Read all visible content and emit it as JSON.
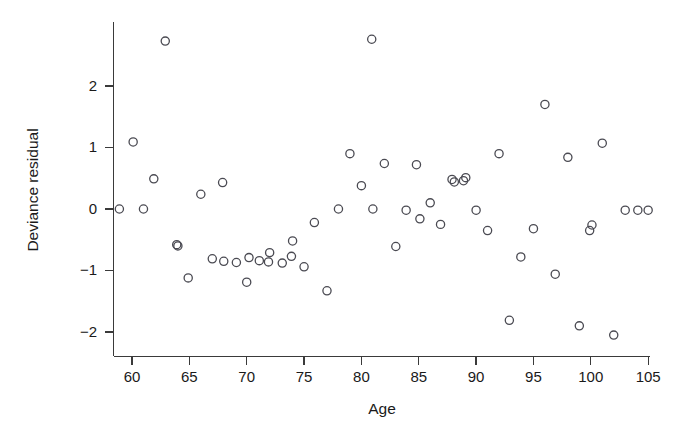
{
  "chart_data": {
    "type": "scatter",
    "title": "",
    "xlabel": "Age",
    "ylabel": "Deviance residual",
    "xlim": [
      58.2,
      105.8
    ],
    "ylim": [
      -2.35,
      3.0
    ],
    "xticks": [
      60,
      65,
      70,
      75,
      80,
      85,
      90,
      95,
      100,
      105
    ],
    "yticks": [
      2,
      1,
      0,
      -1,
      -2
    ],
    "xtick_labels": [
      "60",
      "65",
      "70",
      "75",
      "80",
      "85",
      "90",
      "95",
      "100",
      "105"
    ],
    "ytick_labels": [
      "2",
      "1",
      "0",
      "-1",
      "-2"
    ],
    "grid": false,
    "legend": null,
    "marker": "open-circle",
    "marker_color": "#4a4a52",
    "n_points": 57,
    "x": [
      58.9,
      60.1,
      61.0,
      61.9,
      62.9,
      64.0,
      64.9,
      66.0,
      67.0,
      67.9,
      69.1,
      70.0,
      70.2,
      71.1,
      72.0,
      73.1,
      74.0,
      75.0,
      75.9,
      77.0,
      79.0,
      80.0,
      80.9,
      82.0,
      83.0,
      83.9,
      84.8,
      85.1,
      86.0,
      86.9,
      87.9,
      88.1,
      88.9,
      89.1,
      90.0,
      91.0,
      92.0,
      92.9,
      93.9,
      95.0,
      96.0,
      96.9,
      98.0,
      99.0,
      99.9,
      100.1,
      101.0,
      102.0,
      103.0,
      104.1,
      105.0,
      78.0,
      81.0,
      73.9,
      68.0,
      63.9,
      71.9
    ],
    "y": [
      0.0,
      1.09,
      0.0,
      0.49,
      2.73,
      -0.6,
      -1.12,
      0.24,
      -0.81,
      0.43,
      -0.87,
      -1.19,
      -0.79,
      -0.84,
      -0.71,
      -0.88,
      -0.52,
      -0.94,
      -0.22,
      -1.33,
      0.9,
      0.38,
      2.76,
      0.74,
      -0.61,
      -0.02,
      0.72,
      -0.16,
      0.1,
      -0.25,
      0.48,
      0.44,
      0.46,
      0.51,
      -0.02,
      -0.35,
      0.9,
      -1.81,
      -0.78,
      -0.32,
      1.7,
      -1.06,
      0.84,
      -1.9,
      -0.35,
      -0.26,
      1.07,
      -2.05,
      -0.02,
      -0.02,
      -0.02,
      0.0,
      0.0,
      -0.77,
      -0.85,
      -0.58,
      -0.86
    ],
    "points": [
      {
        "x": 58.9,
        "y": 0.0
      },
      {
        "x": 60.1,
        "y": 1.09
      },
      {
        "x": 61.0,
        "y": 0.0
      },
      {
        "x": 61.9,
        "y": 0.49
      },
      {
        "x": 62.9,
        "y": 2.73
      },
      {
        "x": 64.0,
        "y": -0.6
      },
      {
        "x": 64.9,
        "y": -1.12
      },
      {
        "x": 66.0,
        "y": 0.24
      },
      {
        "x": 67.0,
        "y": -0.81
      },
      {
        "x": 67.9,
        "y": 0.43
      },
      {
        "x": 69.1,
        "y": -0.87
      },
      {
        "x": 70.0,
        "y": -1.19
      },
      {
        "x": 70.2,
        "y": -0.79
      },
      {
        "x": 71.1,
        "y": -0.84
      },
      {
        "x": 72.0,
        "y": -0.71
      },
      {
        "x": 73.1,
        "y": -0.88
      },
      {
        "x": 74.0,
        "y": -0.52
      },
      {
        "x": 75.0,
        "y": -0.94
      },
      {
        "x": 75.9,
        "y": -0.22
      },
      {
        "x": 77.0,
        "y": -1.33
      },
      {
        "x": 79.0,
        "y": 0.9
      },
      {
        "x": 80.0,
        "y": 0.38
      },
      {
        "x": 80.9,
        "y": 2.76
      },
      {
        "x": 82.0,
        "y": 0.74
      },
      {
        "x": 83.0,
        "y": -0.61
      },
      {
        "x": 83.9,
        "y": -0.02
      },
      {
        "x": 84.8,
        "y": 0.72
      },
      {
        "x": 85.1,
        "y": -0.16
      },
      {
        "x": 86.0,
        "y": 0.1
      },
      {
        "x": 86.9,
        "y": -0.25
      },
      {
        "x": 87.9,
        "y": 0.48
      },
      {
        "x": 88.1,
        "y": 0.44
      },
      {
        "x": 88.9,
        "y": 0.46
      },
      {
        "x": 89.1,
        "y": 0.51
      },
      {
        "x": 90.0,
        "y": -0.02
      },
      {
        "x": 91.0,
        "y": -0.35
      },
      {
        "x": 92.0,
        "y": 0.9
      },
      {
        "x": 92.9,
        "y": -1.81
      },
      {
        "x": 93.9,
        "y": -0.78
      },
      {
        "x": 95.0,
        "y": -0.32
      },
      {
        "x": 96.0,
        "y": 1.7
      },
      {
        "x": 96.9,
        "y": -1.06
      },
      {
        "x": 98.0,
        "y": 0.84
      },
      {
        "x": 99.0,
        "y": -1.9
      },
      {
        "x": 99.9,
        "y": -0.35
      },
      {
        "x": 100.1,
        "y": -0.26
      },
      {
        "x": 101.0,
        "y": 1.07
      },
      {
        "x": 102.0,
        "y": -2.05
      },
      {
        "x": 103.0,
        "y": -0.02
      },
      {
        "x": 104.1,
        "y": -0.02
      },
      {
        "x": 105.0,
        "y": -0.02
      },
      {
        "x": 78.0,
        "y": 0.0
      },
      {
        "x": 81.0,
        "y": 0.0
      },
      {
        "x": 73.9,
        "y": -0.77
      },
      {
        "x": 68.0,
        "y": -0.85
      },
      {
        "x": 63.9,
        "y": -0.58
      },
      {
        "x": 71.9,
        "y": -0.86
      }
    ]
  },
  "axes": {
    "y_title": "Deviance residual",
    "x_title": "Age"
  }
}
